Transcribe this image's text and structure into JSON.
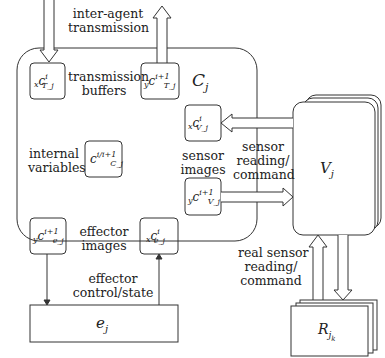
{
  "diagram": {
    "agent_box": {
      "label": "C",
      "subscript": "j"
    },
    "labels": {
      "inter_agent": [
        "inter-agent",
        "transmission"
      ],
      "transmission_buffers": [
        "transmission",
        "buffers"
      ],
      "internal_variables": [
        "internal",
        "variables"
      ],
      "sensor_images": [
        "sensor",
        "images"
      ],
      "effector_images": [
        "effector",
        "images"
      ],
      "sensor_reading": [
        "sensor",
        "reading/",
        "command"
      ],
      "real_sensor_reading": [
        "real sensor",
        "reading/",
        "command"
      ],
      "effector_control": [
        "effector",
        "control/state"
      ]
    },
    "cells": {
      "x_c_Tj": {
        "prefix": "x",
        "base": "c",
        "sup": "i",
        "sub": "T_j"
      },
      "y_c_Tj": {
        "prefix": "y",
        "base": "c",
        "sup": "i+1",
        "sub": "T_j"
      },
      "c_Cj": {
        "prefix": "",
        "base": "c",
        "sup": "i/i+1",
        "sub": "C_j"
      },
      "x_c_Vj": {
        "prefix": "x",
        "base": "c",
        "sup": "i",
        "sub": "V_j"
      },
      "y_c_Vj": {
        "prefix": "y",
        "base": "c",
        "sup": "i+1",
        "sub": "V_j"
      },
      "y_c_ej": {
        "prefix": "y",
        "base": "c",
        "sup": "i+1",
        "sub": "e_j"
      },
      "x_c_ej": {
        "prefix": "x",
        "base": "c",
        "sup": "i",
        "sub": "e_j"
      }
    },
    "sensor_stack": {
      "label": "V",
      "subscript": "j"
    },
    "effector_box": {
      "label": "e",
      "subscript": "j"
    },
    "real_sensor_stack": {
      "label": "R",
      "subscript": "j",
      "subsubscript": "k"
    },
    "colors": {
      "stroke": "#333333",
      "background": "#ffffff",
      "text": "#222222"
    }
  }
}
